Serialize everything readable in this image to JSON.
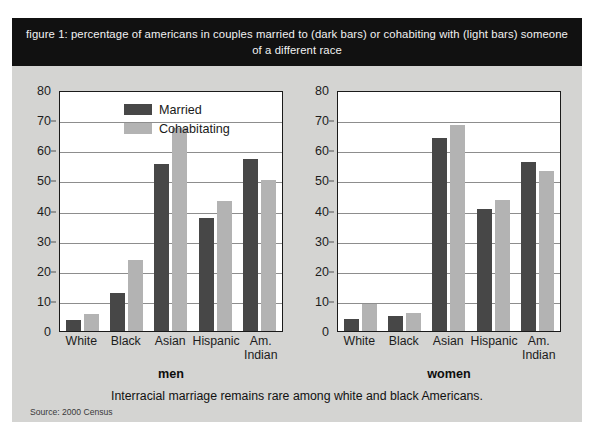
{
  "figure": {
    "title": "figure 1: percentage of americans in couples married to (dark bars) or cohabiting with (light bars) someone of a different race",
    "caption": "Interracial marriage remains rare among white and black Americans.",
    "source": "Source: 2000 Census",
    "panel_men_title": "men",
    "panel_women_title": "women",
    "legend": {
      "married": "Married",
      "cohabitating": "Cohabitating"
    },
    "colors": {
      "married_bar": "#474747",
      "cohabitating_bar": "#b3b3b3",
      "title_band": "#111111",
      "background": "#d4d4d2",
      "plot_background": "#ffffff",
      "gridline": "#8d8d8d",
      "axis": "#1a1a1a"
    }
  },
  "chart_data": [
    {
      "type": "bar",
      "title": "men",
      "categories": [
        "White",
        "Black",
        "Asian",
        "Hispanic",
        "Am. Indian"
      ],
      "series": [
        {
          "name": "Married",
          "values": [
            3.5,
            12.5,
            55.5,
            37.5,
            57
          ]
        },
        {
          "name": "Cohabitating",
          "values": [
            5.5,
            23.5,
            67.5,
            43,
            50
          ]
        }
      ],
      "xlabel": "",
      "ylabel": "",
      "ylim": [
        0,
        80
      ],
      "yticks": [
        0,
        10,
        20,
        30,
        40,
        50,
        60,
        70,
        80
      ],
      "grid": true,
      "legend_position": "top-left"
    },
    {
      "type": "bar",
      "title": "women",
      "categories": [
        "White",
        "Black",
        "Asian",
        "Hispanic",
        "Am. Indian"
      ],
      "series": [
        {
          "name": "Married",
          "values": [
            4,
            5,
            64,
            40.5,
            56
          ]
        },
        {
          "name": "Cohabitating",
          "values": [
            9,
            6,
            68.5,
            43.5,
            53
          ]
        }
      ],
      "xlabel": "",
      "ylabel": "",
      "ylim": [
        0,
        80
      ],
      "yticks": [
        0,
        10,
        20,
        30,
        40,
        50,
        60,
        70,
        80
      ],
      "grid": false,
      "legend_position": "none"
    }
  ]
}
